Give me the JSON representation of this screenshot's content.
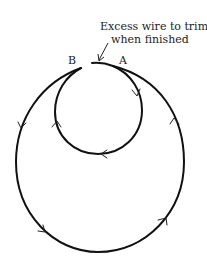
{
  "diagram": {
    "annotation_line1": "Excess wire to trim",
    "annotation_line2": "when finished",
    "point_a": "A",
    "point_b": "B",
    "elements": {
      "inner_loop": {
        "direction": "clockwise",
        "icon": "arrowhead"
      },
      "outer_loop": {
        "direction": "counter-clockwise",
        "icon": "arrowhead"
      },
      "pointer": {
        "icon": "arrow-pointer"
      }
    },
    "colors": {
      "line": "#111111",
      "text": "#222222",
      "background": "#ffffff"
    }
  }
}
